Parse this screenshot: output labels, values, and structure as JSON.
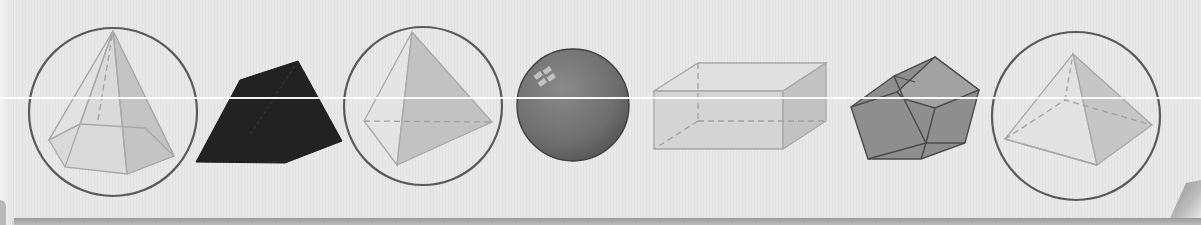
{
  "figure": {
    "shapes": [
      {
        "id": "hexagonal-pyramid",
        "label": "Hexagonal pyramid",
        "circled": true
      },
      {
        "id": "trapezoidal-prism",
        "label": "Dark trapezoidal solid",
        "circled": false
      },
      {
        "id": "triangular-pyramid",
        "label": "Triangular pyramid",
        "circled": true
      },
      {
        "id": "sphere",
        "label": "Sphere",
        "circled": false
      },
      {
        "id": "rectangular-prism",
        "label": "Rectangular prism",
        "circled": false
      },
      {
        "id": "dodecahedron",
        "label": "Dodecahedron",
        "circled": false
      },
      {
        "id": "square-pyramid",
        "label": "Square pyramid",
        "circled": true
      }
    ],
    "colors": {
      "background": "#e9e9e9",
      "circle_stroke": "#5a5a5a",
      "light_face": "#d6d6d6",
      "mid_face": "#bdbdbd",
      "edge": "#a8a8a8",
      "dark_solid": "#222222",
      "sphere": "#777777",
      "polyhedron": "#8e8e8e"
    }
  }
}
